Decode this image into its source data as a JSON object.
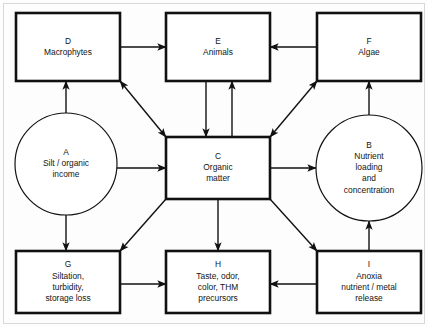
{
  "diagram": {
    "background_color": "#fdfdfd",
    "line_color": "#111111",
    "node_fill": "#ffffff",
    "nodes": [
      {
        "id": "D",
        "key": "D",
        "shape": "rect",
        "label_lines": [
          "Macrophytes"
        ],
        "x": 16,
        "y": 13,
        "w": 104,
        "h": 68
      },
      {
        "id": "E",
        "key": "E",
        "shape": "rect",
        "label_lines": [
          "Animals"
        ],
        "x": 166,
        "y": 13,
        "w": 104,
        "h": 68
      },
      {
        "id": "F",
        "key": "F",
        "shape": "rect",
        "label_lines": [
          "Algae"
        ],
        "x": 317,
        "y": 13,
        "w": 104,
        "h": 68
      },
      {
        "id": "A",
        "key": "A",
        "shape": "circle",
        "label_lines": [
          "Silt / organic",
          "income"
        ],
        "cx": 66,
        "cy": 164,
        "r": 51
      },
      {
        "id": "C",
        "key": "C",
        "shape": "rect",
        "label_lines": [
          "Organic",
          "matter"
        ],
        "x": 166,
        "y": 137,
        "w": 104,
        "h": 62
      },
      {
        "id": "B",
        "key": "B",
        "shape": "circle",
        "label_lines": [
          "Nutrient",
          "loading",
          "and",
          "concentration"
        ],
        "cx": 369,
        "cy": 168,
        "r": 53
      },
      {
        "id": "G",
        "key": "G",
        "shape": "rect",
        "label_lines": [
          "Siltation,",
          "turbidity,",
          "storage loss"
        ],
        "x": 16,
        "y": 251,
        "w": 104,
        "h": 62
      },
      {
        "id": "H",
        "key": "H",
        "shape": "rect",
        "label_lines": [
          "Taste, odor,",
          "color, THM",
          "precursors"
        ],
        "x": 166,
        "y": 251,
        "w": 104,
        "h": 62
      },
      {
        "id": "I",
        "key": "I",
        "shape": "rect",
        "label_lines": [
          "Anoxia",
          "nutrient / metal",
          "release"
        ],
        "x": 317,
        "y": 251,
        "w": 104,
        "h": 62
      }
    ],
    "edges": [
      {
        "id": "D-to-E",
        "from": "D",
        "to": "E",
        "arrow": "single",
        "points": [
          [
            120,
            47
          ],
          [
            166,
            47
          ]
        ]
      },
      {
        "id": "F-to-E",
        "from": "F",
        "to": "E",
        "arrow": "single",
        "points": [
          [
            317,
            47
          ],
          [
            270,
            47
          ]
        ]
      },
      {
        "id": "A-to-D",
        "from": "A",
        "to": "D",
        "arrow": "single",
        "points": [
          [
            66,
            113
          ],
          [
            66,
            81
          ]
        ]
      },
      {
        "id": "D-to-C-bidirectional",
        "from": "D",
        "to": "C",
        "arrow": "double",
        "points": [
          [
            120,
            81
          ],
          [
            166,
            137
          ]
        ]
      },
      {
        "id": "C-to-F-bidirectional",
        "from": "C",
        "to": "F",
        "arrow": "double",
        "points": [
          [
            270,
            137
          ],
          [
            317,
            81
          ]
        ]
      },
      {
        "id": "E-to-C",
        "from": "E",
        "to": "C",
        "arrow": "single",
        "points": [
          [
            206,
            81
          ],
          [
            206,
            137
          ]
        ]
      },
      {
        "id": "C-to-E",
        "from": "C",
        "to": "E",
        "arrow": "single",
        "points": [
          [
            232,
            137
          ],
          [
            232,
            81
          ]
        ]
      },
      {
        "id": "B-to-F",
        "from": "B",
        "to": "F",
        "arrow": "single",
        "points": [
          [
            369,
            115
          ],
          [
            369,
            81
          ]
        ]
      },
      {
        "id": "A-to-C",
        "from": "A",
        "to": "C",
        "arrow": "single",
        "points": [
          [
            117,
            168
          ],
          [
            166,
            168
          ]
        ]
      },
      {
        "id": "C-to-B",
        "from": "C",
        "to": "B",
        "arrow": "single",
        "points": [
          [
            270,
            168
          ],
          [
            316,
            168
          ]
        ]
      },
      {
        "id": "A-to-G",
        "from": "A",
        "to": "G",
        "arrow": "single",
        "points": [
          [
            66,
            215
          ],
          [
            66,
            251
          ]
        ]
      },
      {
        "id": "C-to-G",
        "from": "C",
        "to": "G",
        "arrow": "single",
        "points": [
          [
            166,
            199
          ],
          [
            120,
            251
          ]
        ]
      },
      {
        "id": "C-to-H",
        "from": "C",
        "to": "H",
        "arrow": "single",
        "points": [
          [
            218,
            199
          ],
          [
            218,
            251
          ]
        ]
      },
      {
        "id": "C-to-I",
        "from": "C",
        "to": "I",
        "arrow": "single",
        "points": [
          [
            270,
            199
          ],
          [
            317,
            251
          ]
        ]
      },
      {
        "id": "I-to-B",
        "from": "I",
        "to": "B",
        "arrow": "single",
        "points": [
          [
            369,
            251
          ],
          [
            369,
            221
          ]
        ]
      },
      {
        "id": "G-to-H",
        "from": "G",
        "to": "H",
        "arrow": "single",
        "points": [
          [
            120,
            284
          ],
          [
            166,
            284
          ]
        ]
      },
      {
        "id": "I-to-H",
        "from": "I",
        "to": "H",
        "arrow": "single",
        "points": [
          [
            317,
            284
          ],
          [
            270,
            284
          ]
        ]
      }
    ]
  }
}
